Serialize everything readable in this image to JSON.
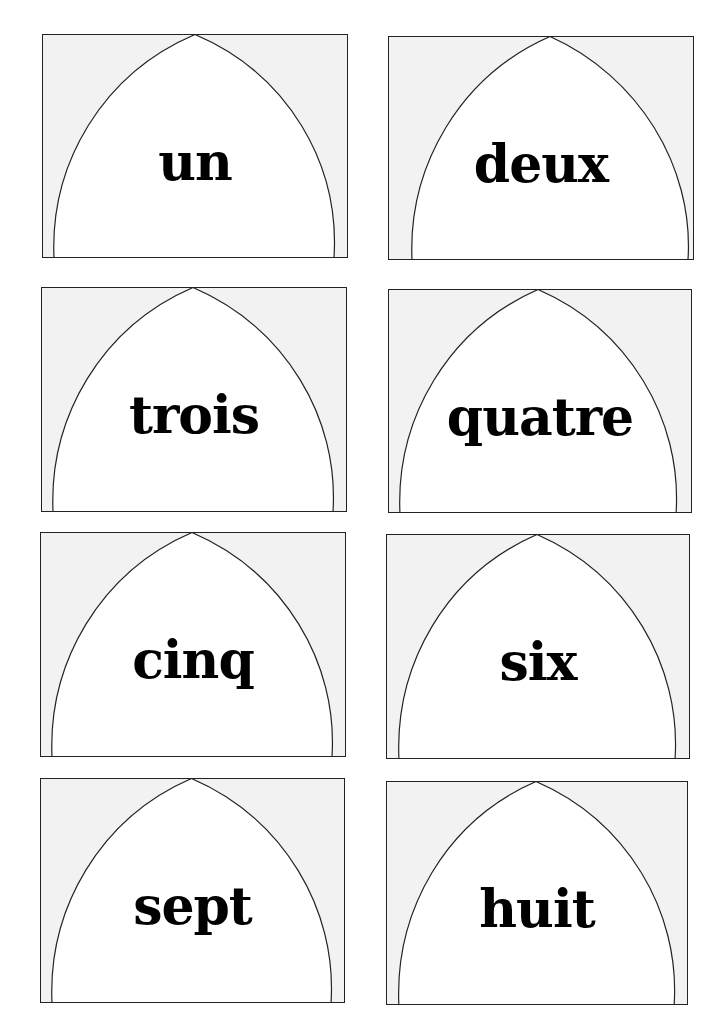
{
  "worksheet": {
    "colors": {
      "card_background": "#f2f2f2",
      "arch_fill": "#ffffff",
      "outline": "#222222",
      "text": "#000000"
    },
    "cards": [
      {
        "label": "un",
        "x": 42,
        "y": 34,
        "w": 306,
        "h": 224
      },
      {
        "label": "deux",
        "x": 388,
        "y": 36,
        "w": 306,
        "h": 224
      },
      {
        "label": "trois",
        "x": 41,
        "y": 287,
        "w": 306,
        "h": 225
      },
      {
        "label": "quatre",
        "x": 388,
        "y": 289,
        "w": 304,
        "h": 224
      },
      {
        "label": "cinq",
        "x": 40,
        "y": 532,
        "w": 306,
        "h": 225
      },
      {
        "label": "six",
        "x": 386,
        "y": 534,
        "w": 304,
        "h": 225
      },
      {
        "label": "sept",
        "x": 40,
        "y": 778,
        "w": 305,
        "h": 225
      },
      {
        "label": "huit",
        "x": 386,
        "y": 781,
        "w": 302,
        "h": 224
      }
    ]
  }
}
